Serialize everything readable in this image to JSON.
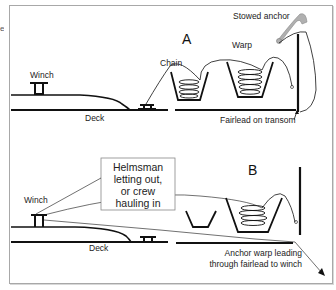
{
  "stray_text": "e",
  "panel_a": {
    "label": "A",
    "winch_label": "Winch",
    "deck_label": "Deck",
    "chain_label": "Chain",
    "warp_label": "Warp",
    "stowed_anchor_label": "Stowed anchor",
    "fairlead_label": "Fairlead on transom"
  },
  "panel_b": {
    "label": "B",
    "winch_label": "Winch",
    "deck_label": "Deck",
    "callout": {
      "line1": "Helmsman",
      "line2": "letting out,",
      "line3": "or crew",
      "line4": "hauling in"
    },
    "warp_caption": {
      "line1": "Anchor warp leading",
      "line2": "through fairlead to winch"
    }
  },
  "colors": {
    "line": "#111111",
    "anchor_fill": "#b0b0b0",
    "frame_border": "#a8a8a8"
  }
}
